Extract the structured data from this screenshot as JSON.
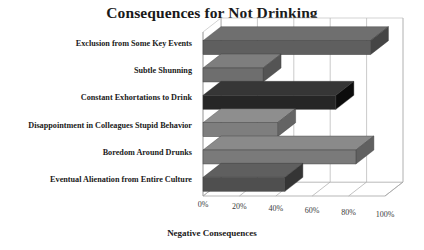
{
  "chart_data": {
    "type": "bar",
    "orientation": "horizontal",
    "style": "3d",
    "title": "Consequences for Not Drinking",
    "xlabel": "Negative Consequences",
    "ylabel": "",
    "categories": [
      "Exclusion from Some Key Events",
      "Subtle Shunning",
      "Constant Exhortations to Drink",
      "Disappointment in Colleagues Stupid Behavior",
      "Boredom Around Drunks",
      "Eventual Alienation from Entire Culture"
    ],
    "values": [
      92,
      33,
      73,
      41,
      84,
      45
    ],
    "xtick_labels": [
      "0%",
      "20%",
      "40%",
      "60%",
      "80%",
      "100%"
    ],
    "xtick_values": [
      0,
      20,
      40,
      60,
      80,
      100
    ],
    "xlim": [
      0,
      100
    ],
    "grid": true,
    "legend": false,
    "bar_colors": [
      "#5f5f5f",
      "#6e6e6e",
      "#262626",
      "#7e7e7e",
      "#7a7a7a",
      "#4f4f4f"
    ]
  },
  "colors": {
    "background": "#ffffff",
    "text": "#1a1a1a",
    "gridline": "#bdbdbd",
    "wall": "#ffffff"
  }
}
